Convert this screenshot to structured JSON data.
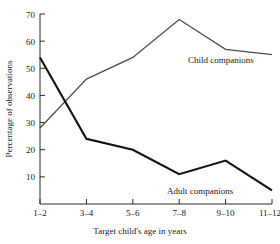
{
  "chart_data": {
    "type": "line",
    "title": "",
    "xlabel": "Target child's age in years",
    "ylabel": "Percentage of observations",
    "categories": [
      "1–2",
      "3–4",
      "5–6",
      "7–8",
      "9–10",
      "11–12"
    ],
    "series": [
      {
        "name": "Child companions",
        "values": [
          28,
          46,
          54,
          68,
          57,
          55
        ],
        "color": "#4d4d4d",
        "label_text": "Child companions"
      },
      {
        "name": "Adult companions",
        "values": [
          54,
          24,
          20,
          11,
          16,
          5
        ],
        "color": "#111111",
        "label_text": "Adult companions"
      }
    ],
    "ylim": [
      0,
      70
    ],
    "xlim": [
      0,
      5
    ],
    "yticks": [
      10,
      20,
      30,
      40,
      50,
      60,
      70
    ],
    "ytick_labels": [
      "10",
      "20",
      "30",
      "40",
      "50",
      "60",
      "70"
    ],
    "xtick_labels": [
      "1–2",
      "3–4",
      "5–6",
      "7–8",
      "9–10",
      "11–12"
    ],
    "grid": false,
    "legend_position": "inline-annotations"
  },
  "axis": {
    "y_title": "Percentage of observations",
    "x_title": "Target child's age in years"
  },
  "annotations": {
    "child": "Child companions",
    "adult": "Adult companions"
  },
  "ticks": {
    "y": [
      "70",
      "60",
      "50",
      "40",
      "30",
      "20",
      "10"
    ],
    "x": [
      "1–2",
      "3–4",
      "5–6",
      "7–8",
      "9–10",
      "11–12"
    ]
  }
}
